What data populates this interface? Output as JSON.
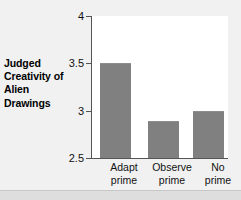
{
  "chart_data": {
    "type": "bar",
    "title": "",
    "subtitle": "",
    "xlabel": "",
    "ylabel": "Judged Creativity of Alien Drawings",
    "ylabel_lines": [
      "Judged",
      "Creativity of",
      "Alien",
      "Drawings"
    ],
    "categories": [
      "Adapt prime",
      "Observe prime",
      "No prime"
    ],
    "category_lines": [
      [
        "Adapt",
        "prime"
      ],
      [
        "Observe",
        "prime"
      ],
      [
        "No",
        "prime"
      ]
    ],
    "values": [
      3.51,
      2.9,
      3.0
    ],
    "ylim": [
      2.5,
      4
    ],
    "yticks": [
      4,
      3.5,
      3,
      2.5
    ],
    "ytick_labels": [
      "4",
      "3.5",
      "3",
      "2.5"
    ],
    "grid": false,
    "legend": null,
    "colors": {
      "bar_fill": "#808080",
      "plot_background": "#ffffff",
      "figure_background": "#f1f1f1",
      "axis_line": "#555555",
      "text": "#111111"
    }
  }
}
